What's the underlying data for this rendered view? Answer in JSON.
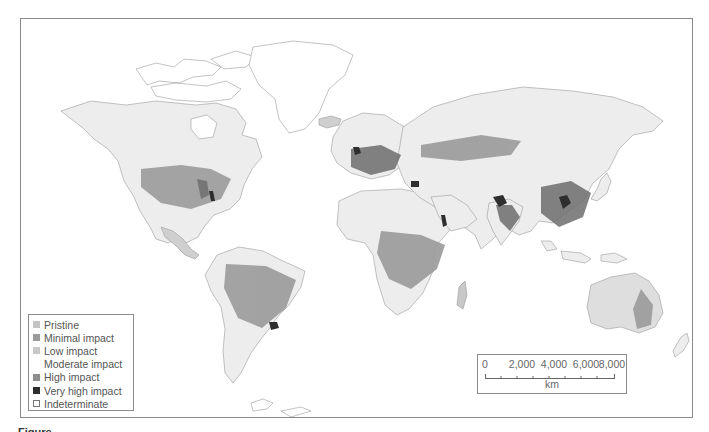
{
  "map": {
    "type": "world human-impact map",
    "colors": {
      "pristine": "#c4c4c4",
      "minimal_impact": "#9a9a9a",
      "low_impact": "#c8c8c8",
      "moderate_impact": "#ececec",
      "high_impact": "#8e8e8e",
      "very_high_impact": "#2e2e2e",
      "indeterminate": "#ffffff",
      "ocean": "#ffffff",
      "land_base": "#ededed",
      "outline": "#8a8a8a"
    }
  },
  "legend": {
    "items": [
      {
        "label": "Pristine",
        "color": "#c4c4c4"
      },
      {
        "label": "Minimal impact",
        "color": "#9a9a9a"
      },
      {
        "label": "Low impact",
        "color": "#c8c8c8"
      },
      {
        "label": "Moderate impact",
        "color": "#ffffff"
      },
      {
        "label": "High impact",
        "color": "#8e8e8e"
      },
      {
        "label": "Very high impact",
        "color": "#2e2e2e"
      },
      {
        "label": "Indeterminate",
        "color": "#ffffff"
      }
    ]
  },
  "scale": {
    "ticks": [
      "0",
      "2,000",
      "4,000",
      "6,000",
      "8,000"
    ],
    "unit": "km"
  },
  "caption": {
    "text": "Figure"
  }
}
